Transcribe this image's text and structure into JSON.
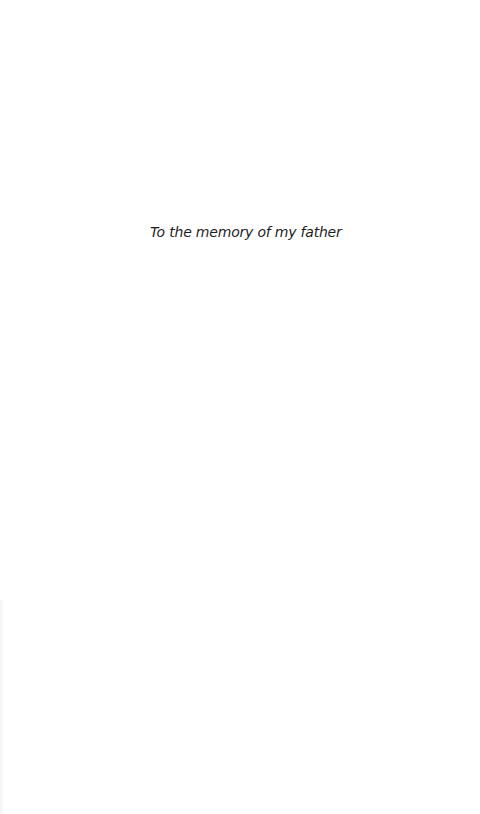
{
  "page": {
    "type": "dedication",
    "dedication_text": "To the memory of my father"
  },
  "colors": {
    "background": "#ffffff",
    "text": "#1e1e1e"
  }
}
